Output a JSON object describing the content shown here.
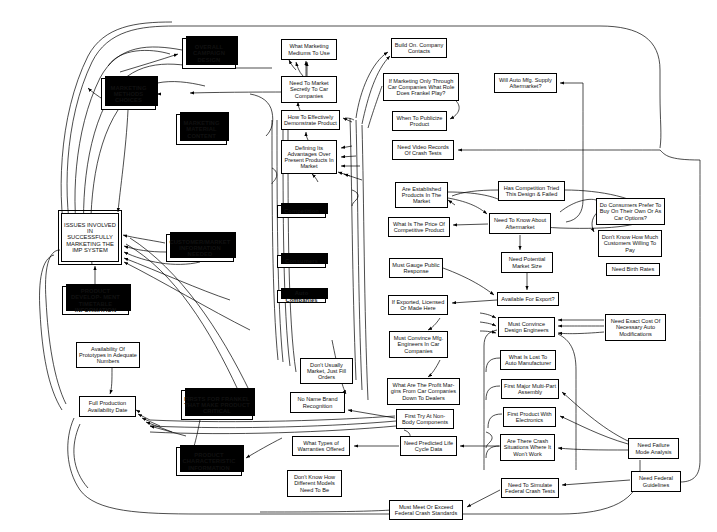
{
  "diagram": {
    "kind": "affinity-influence-map",
    "title": "",
    "nodes": [
      {
        "id": "overall-campaign-design",
        "label": "OVERALL CAMPAIGN DESIGN",
        "style": "shadow",
        "x": 182,
        "y": 38,
        "w": 54,
        "h": 31
      },
      {
        "id": "marketing-methods-choices",
        "label": "MARKETING METHODS CHOICES",
        "style": "shadow",
        "x": 101,
        "y": 78,
        "w": 55,
        "h": 32
      },
      {
        "id": "marketing-material-content",
        "label": "MARKETING MATERIAL CONTENT",
        "style": "shadow",
        "x": 176,
        "y": 114,
        "w": 51,
        "h": 31
      },
      {
        "id": "issues-involved",
        "label": "ISSUES INVOLVED IN SUCCESSFULLY MARKETING THE IMP SYSTEM",
        "style": "double",
        "x": 61,
        "y": 213,
        "w": 58,
        "h": 49
      },
      {
        "id": "customer-market-information-needed",
        "label": "CUSTOMER/MARKET INFORMATION NEEDED",
        "style": "shadow",
        "x": 166,
        "y": 234,
        "w": 68,
        "h": 28
      },
      {
        "id": "product-development-timetable",
        "label": "PRODUCT DEVELOP- MENT TIMETABLE INFORMATION",
        "style": "shadow",
        "x": 62,
        "y": 286,
        "w": 67,
        "h": 29
      },
      {
        "id": "availability-of-prototypes",
        "label": "Availability Of Prototypes in Adequate Numbers",
        "style": "plain",
        "x": 76,
        "y": 342,
        "w": 64,
        "h": 26
      },
      {
        "id": "firsts-for-frankel",
        "label": "FIRSTS FOR FRANKEL THAT MAKE PRODUCT CRITICAL",
        "style": "shadow",
        "x": 181,
        "y": 390,
        "w": 72,
        "h": 30
      },
      {
        "id": "full-production-availability-date",
        "label": "Full Production Availability Date",
        "style": "plain",
        "x": 79,
        "y": 396,
        "w": 57,
        "h": 21
      },
      {
        "id": "product-characteristic-information",
        "label": "PRODUCT CHARACTERISTIC INFORMATION",
        "style": "shadow",
        "x": 176,
        "y": 447,
        "w": 66,
        "h": 29
      },
      {
        "id": "competition",
        "label": "Competition",
        "style": "shadow",
        "x": 277,
        "y": 205,
        "w": 49,
        "h": 13
      },
      {
        "id": "consumers",
        "label": "Consumers",
        "style": "shadow",
        "x": 277,
        "y": 255,
        "w": 49,
        "h": 13
      },
      {
        "id": "auto-companies",
        "label": "Auto Companies",
        "style": "shadow",
        "x": 277,
        "y": 290,
        "w": 49,
        "h": 13
      },
      {
        "id": "what-marketing-mediums",
        "label": "What Marketing Mediums To Use",
        "style": "plain",
        "x": 281,
        "y": 39,
        "w": 56,
        "h": 21
      },
      {
        "id": "need-to-market-secretly",
        "label": "Need To Market Secretly To Car Companies",
        "style": "plain",
        "x": 281,
        "y": 76,
        "w": 56,
        "h": 27
      },
      {
        "id": "how-to-effectively-demonstrate",
        "label": "How To Effectively Demonstrate Product",
        "style": "plain",
        "x": 281,
        "y": 110,
        "w": 59,
        "h": 20
      },
      {
        "id": "defining-its-advantages",
        "label": "Defining Its Advantages Over Present Products In  Market",
        "style": "plain",
        "x": 281,
        "y": 140,
        "w": 56,
        "h": 34
      },
      {
        "id": "dont-usually-market",
        "label": "Don't Usually Market, Just Fill Orders",
        "style": "plain",
        "x": 300,
        "y": 358,
        "w": 53,
        "h": 26
      },
      {
        "id": "no-name-brand-recognition",
        "label": "No Name Brand Recognition",
        "style": "plain",
        "x": 290,
        "y": 392,
        "w": 55,
        "h": 21
      },
      {
        "id": "what-types-of-warranties",
        "label": "What Types of Warranties Offered",
        "style": "plain",
        "x": 292,
        "y": 436,
        "w": 58,
        "h": 20
      },
      {
        "id": "dont-know-how-different-models",
        "label": "Don't Know How Different Models Need To Be",
        "style": "plain",
        "x": 287,
        "y": 470,
        "w": 55,
        "h": 27
      },
      {
        "id": "build-on-company-contacts",
        "label": "Build On. Company Contacts",
        "style": "plain",
        "x": 391,
        "y": 38,
        "w": 56,
        "h": 20
      },
      {
        "id": "if-marketing-only-through",
        "label": "If Marketing Only Through Car Companies What Role Does Frankel Play?",
        "style": "plain",
        "x": 383,
        "y": 73,
        "w": 76,
        "h": 28
      },
      {
        "id": "when-to-publicize-product",
        "label": "When To Publicize Product",
        "style": "plain",
        "x": 392,
        "y": 111,
        "w": 55,
        "h": 20
      },
      {
        "id": "need-video-records",
        "label": "Need Video Records Of Crash Tests",
        "style": "plain",
        "x": 392,
        "y": 140,
        "w": 62,
        "h": 20
      },
      {
        "id": "are-established-products",
        "label": "Are Established Products In The Market",
        "style": "plain",
        "x": 395,
        "y": 182,
        "w": 53,
        "h": 26
      },
      {
        "id": "what-is-the-price",
        "label": "What Is The Price Of Competitive Product",
        "style": "plain",
        "x": 388,
        "y": 217,
        "w": 62,
        "h": 20
      },
      {
        "id": "must-gauge-public-response",
        "label": "Must Gauge Public Response",
        "style": "plain",
        "x": 389,
        "y": 258,
        "w": 54,
        "h": 20
      },
      {
        "id": "if-exported-licensed",
        "label": "If Exported, Licensed Or Made Here",
        "style": "plain",
        "x": 388,
        "y": 295,
        "w": 60,
        "h": 20
      },
      {
        "id": "must-convince-mfg-engineers",
        "label": "Must Convince Mfg. Engineers In Car Companies",
        "style": "plain",
        "x": 389,
        "y": 331,
        "w": 59,
        "h": 27
      },
      {
        "id": "what-are-the-profit-margins",
        "label": "What Are The Profit Mar- gins From Car Companies Down To Dealers",
        "style": "plain",
        "x": 387,
        "y": 378,
        "w": 73,
        "h": 27
      },
      {
        "id": "first-try-at-non-body",
        "label": "First Try At Non- Body Components",
        "style": "plain",
        "x": 396,
        "y": 409,
        "w": 58,
        "h": 20
      },
      {
        "id": "need-predicted-life-cycle",
        "label": "Need Predicted Life Cycle Data",
        "style": "plain",
        "x": 400,
        "y": 436,
        "w": 57,
        "h": 20
      },
      {
        "id": "must-meet-or-exceed",
        "label": "Must Meet Or Exceed Federal Crash Standards",
        "style": "plain",
        "x": 389,
        "y": 500,
        "w": 74,
        "h": 20
      },
      {
        "id": "will-auto-mfg-supply",
        "label": "Will Auto Mfg. Supply Aftermarket?",
        "style": "plain",
        "x": 494,
        "y": 73,
        "w": 63,
        "h": 20
      },
      {
        "id": "has-competition-tried",
        "label": "Has Competition Tried This Design & Failed",
        "style": "plain",
        "x": 498,
        "y": 181,
        "w": 67,
        "h": 20
      },
      {
        "id": "need-to-know-about-aftermarket",
        "label": "Need To Know About Aftermarket",
        "style": "plain",
        "x": 489,
        "y": 213,
        "w": 62,
        "h": 21
      },
      {
        "id": "need-potential-market-size",
        "label": "Need Potential Market Size",
        "style": "plain",
        "x": 501,
        "y": 252,
        "w": 52,
        "h": 21
      },
      {
        "id": "available-for-export",
        "label": "Available For Export?",
        "style": "plain",
        "x": 497,
        "y": 292,
        "w": 62,
        "h": 14
      },
      {
        "id": "must-convince-design-engineers",
        "label": "Must Convince Design Engineers",
        "style": "plain",
        "x": 498,
        "y": 317,
        "w": 57,
        "h": 20
      },
      {
        "id": "what-is-lost-to-auto-manufacturer",
        "label": "What Is Lost To Auto Manufacturer",
        "style": "plain",
        "x": 500,
        "y": 350,
        "w": 56,
        "h": 20
      },
      {
        "id": "first-major-multi-part-assembly",
        "label": "First Major Multi-Part Assembly",
        "style": "plain",
        "x": 501,
        "y": 379,
        "w": 58,
        "h": 20
      },
      {
        "id": "first-product-with-electronics",
        "label": "First Product With Electronics",
        "style": "plain",
        "x": 503,
        "y": 407,
        "w": 53,
        "h": 20
      },
      {
        "id": "are-there-crash-situations",
        "label": "Are There Crash Situations Where It Won't Work",
        "style": "plain",
        "x": 500,
        "y": 434,
        "w": 55,
        "h": 27
      },
      {
        "id": "need-to-simulate-federal-crash-tests",
        "label": "Need To Simulate Federal Crash Tests",
        "style": "plain",
        "x": 501,
        "y": 478,
        "w": 58,
        "h": 20
      },
      {
        "id": "do-consumers-prefer",
        "label": "Do Consumers Prefer To Buy On Their Own Or As Car Options?",
        "style": "plain",
        "x": 596,
        "y": 198,
        "w": 69,
        "h": 27
      },
      {
        "id": "dont-know-how-much-customers",
        "label": "Don't Know How Much Customers Willing To Pay",
        "style": "plain",
        "x": 598,
        "y": 230,
        "w": 64,
        "h": 27
      },
      {
        "id": "need-birth-rates",
        "label": "Need Birth Rates",
        "style": "plain",
        "x": 606,
        "y": 263,
        "w": 54,
        "h": 13
      },
      {
        "id": "need-exact-cost",
        "label": "Need Exact Cost Of Necessary Auto Modifications",
        "style": "plain",
        "x": 605,
        "y": 314,
        "w": 61,
        "h": 27
      },
      {
        "id": "need-failure-mode-analysis",
        "label": "Need Failure Mode Analysis",
        "style": "plain",
        "x": 628,
        "y": 438,
        "w": 51,
        "h": 21
      },
      {
        "id": "need-federal-guidelines",
        "label": "Need Federal Guidelines",
        "style": "plain",
        "x": 631,
        "y": 471,
        "w": 50,
        "h": 21
      }
    ]
  },
  "colors": {
    "stroke": "#000000",
    "fill": "#ffffff",
    "text": "#111111"
  }
}
